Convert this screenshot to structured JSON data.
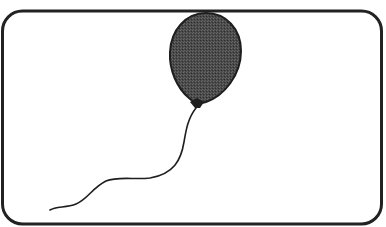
{
  "illustration": {
    "subject": "balloon",
    "description": "Dark gray balloon with a long wavy string inside a rounded rectangle frame",
    "colors": {
      "background": "#ffffff",
      "frame_stroke": "#222222",
      "balloon_fill": "#4a4a4a",
      "balloon_stroke": "#1e1e1e",
      "string_stroke": "#1e1e1e"
    }
  }
}
